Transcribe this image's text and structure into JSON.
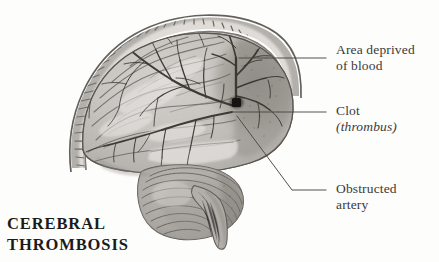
{
  "figure": {
    "title": "CEREBRAL THROMBOSIS",
    "caption_line_1": "CEREBRAL",
    "caption_line_2": "THROMBOSIS",
    "style": "grayscale pencil anatomical illustration, sagittal section of brain within skull",
    "colors": {
      "background": "#fdfdfc",
      "ink": "#3b3a38",
      "caption": "#1c1b1a",
      "leader_line": "#4a4845",
      "brain_light": "#d8d6d2",
      "brain_mid": "#b9b6b1",
      "brain_dark": "#8e8b86",
      "ischemic_region": "#8a8782",
      "vessel": "#3c3a37",
      "clot": "#151413",
      "skull_outer": "#6f6c68",
      "diploe": "#efede9"
    }
  },
  "labels": [
    {
      "id": "area-deprived",
      "line_1": "Area deprived",
      "line_2": "of blood",
      "leader": "horizontal"
    },
    {
      "id": "clot",
      "line_1": "Clot",
      "line_2": "(thrombus)",
      "line_2_italic": true,
      "leader": "horizontal"
    },
    {
      "id": "obstructed-artery",
      "line_1": "Obstructed",
      "line_2": "artery",
      "leader": "elbow-diagonal"
    }
  ],
  "anatomy": {
    "skull": "cranial vault shown in cross-section with diploe layer",
    "cerebrum": "convoluted cerebral hemisphere with gyri and sulci",
    "cerebellum": "striated folia beneath occipital lobe",
    "brainstem": "tapering downward at midline",
    "arteries": "middle cerebral artery branches radiating over hemisphere",
    "clot_marker": "small dark occlusion at arterial branch point",
    "deprived_zone": "darkly shaded posterior territory distal to the clot"
  }
}
